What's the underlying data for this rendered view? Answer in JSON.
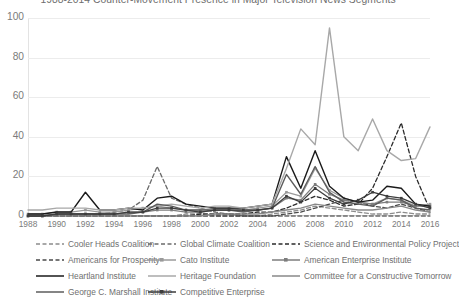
{
  "chart_data": {
    "type": "line",
    "title": "1988-2014 Counter-Movement Presence in Major Television News Segments",
    "xlabel": "",
    "ylabel": "",
    "ylim": [
      0,
      100
    ],
    "yticks": [
      0,
      20,
      40,
      60,
      80,
      100
    ],
    "xlim": [
      1988,
      2016
    ],
    "xticks": [
      1988,
      1990,
      1992,
      1994,
      1996,
      1998,
      2000,
      2002,
      2004,
      2006,
      2008,
      2010,
      2012,
      2014,
      2016
    ],
    "grid": true,
    "legend_position": "bottom",
    "x": [
      1988,
      1989,
      1990,
      1991,
      1992,
      1993,
      1994,
      1995,
      1996,
      1997,
      1998,
      1999,
      2000,
      2001,
      2002,
      2003,
      2004,
      2005,
      2006,
      2007,
      2008,
      2009,
      2010,
      2011,
      2012,
      2013,
      2014,
      2015,
      2016
    ],
    "series": [
      {
        "name": "Cooler Heads Coalition",
        "style": "dashed",
        "color": "#8c8c8c",
        "values": [
          0,
          0,
          0,
          0,
          0,
          0,
          0,
          0,
          0,
          0,
          0,
          1,
          1,
          0,
          0,
          0,
          0,
          1,
          2,
          3,
          5,
          4,
          3,
          2,
          1,
          1,
          2,
          1,
          1
        ]
      },
      {
        "name": "Global Climate Coalition",
        "style": "dashed",
        "color": "#6b6b6b",
        "values": [
          0,
          0,
          0,
          0,
          0,
          1,
          2,
          3,
          8,
          25,
          9,
          6,
          4,
          2,
          1,
          0,
          0,
          0,
          0,
          0,
          0,
          0,
          0,
          0,
          0,
          0,
          0,
          0,
          0
        ]
      },
      {
        "name": "Science and Environmental Policy Project",
        "style": "dashed",
        "color": "#2b2b2b",
        "values": [
          0,
          0,
          0,
          0,
          0,
          0,
          0,
          0,
          0,
          0,
          0,
          0,
          1,
          1,
          1,
          1,
          2,
          2,
          4,
          7,
          10,
          8,
          5,
          6,
          14,
          30,
          47,
          20,
          3
        ]
      },
      {
        "name": "Americans for Prosperity",
        "style": "dashed",
        "color": "#4a4a4a",
        "values": [
          0,
          0,
          0,
          0,
          0,
          0,
          0,
          0,
          0,
          0,
          0,
          0,
          0,
          0,
          0,
          0,
          0,
          0,
          1,
          2,
          4,
          6,
          8,
          7,
          5,
          4,
          6,
          4,
          2
        ]
      },
      {
        "name": "Cato Institute",
        "style": "solid-marker",
        "color": "#9a9a9a",
        "values": [
          1,
          1,
          2,
          2,
          3,
          2,
          2,
          3,
          4,
          5,
          4,
          3,
          3,
          4,
          4,
          3,
          4,
          5,
          12,
          10,
          24,
          13,
          9,
          7,
          6,
          9,
          8,
          5,
          6
        ]
      },
      {
        "name": "American Enterprise Institute",
        "style": "solid-marker",
        "color": "#7d7d7d",
        "values": [
          0,
          0,
          1,
          1,
          1,
          1,
          1,
          2,
          2,
          3,
          3,
          2,
          2,
          3,
          3,
          3,
          3,
          4,
          9,
          8,
          16,
          11,
          8,
          7,
          6,
          7,
          7,
          5,
          5
        ]
      },
      {
        "name": "Heartland Institute",
        "style": "solid",
        "color": "#1a1a1a",
        "values": [
          1,
          1,
          2,
          2,
          12,
          3,
          3,
          4,
          3,
          9,
          10,
          6,
          5,
          4,
          4,
          4,
          5,
          6,
          30,
          14,
          33,
          15,
          9,
          7,
          8,
          15,
          14,
          6,
          5
        ]
      },
      {
        "name": "Heritage Foundation",
        "style": "solid",
        "color": "#a8a8a8",
        "values": [
          3,
          3,
          4,
          4,
          4,
          3,
          3,
          4,
          4,
          5,
          6,
          5,
          4,
          5,
          5,
          4,
          5,
          6,
          24,
          44,
          36,
          95,
          40,
          33,
          49,
          33,
          28,
          29,
          45
        ]
      },
      {
        "name": "Committee for a Constructive Tomorrow",
        "style": "solid",
        "color": "#888888",
        "values": [
          0,
          0,
          0,
          0,
          0,
          0,
          0,
          0,
          0,
          0,
          0,
          0,
          0,
          1,
          1,
          1,
          1,
          2,
          3,
          4,
          6,
          5,
          4,
          3,
          3,
          4,
          5,
          3,
          2
        ]
      },
      {
        "name": "George C. Marshall Institute",
        "style": "solid",
        "color": "#5c5c5c",
        "values": [
          0,
          0,
          1,
          1,
          1,
          1,
          1,
          1,
          2,
          6,
          5,
          3,
          3,
          3,
          3,
          2,
          3,
          4,
          21,
          11,
          25,
          12,
          7,
          6,
          5,
          9,
          8,
          4,
          3
        ]
      },
      {
        "name": "Competitive Enterprise",
        "style": "solid-marker",
        "color": "#3d3d3d",
        "values": [
          0,
          0,
          1,
          1,
          1,
          1,
          1,
          2,
          2,
          4,
          4,
          3,
          2,
          3,
          3,
          3,
          3,
          4,
          10,
          7,
          14,
          9,
          6,
          8,
          12,
          10,
          9,
          6,
          4
        ]
      }
    ]
  },
  "axis": {
    "y_labels": [
      "100",
      "80",
      "60",
      "40",
      "20",
      "0"
    ],
    "x_labels": [
      "1988",
      "1990",
      "1992",
      "1994",
      "1996",
      "1998",
      "2000",
      "2002",
      "2004",
      "2006",
      "2008",
      "2010",
      "2012",
      "2014",
      "2016"
    ]
  },
  "legend": {
    "rows": [
      [
        {
          "label": "Cooler Heads Coalition",
          "style": "dashed",
          "color": "#8c8c8c"
        },
        {
          "label": "Global Climate Coalition",
          "style": "dashed",
          "color": "#6b6b6b"
        },
        {
          "label": "Science and Environmental Policy Project",
          "style": "dashed",
          "color": "#2b2b2b"
        }
      ],
      [
        {
          "label": "Americans for Prosperity",
          "style": "dashed",
          "color": "#4a4a4a"
        },
        {
          "label": "Cato Institute",
          "style": "solid-marker",
          "color": "#9a9a9a"
        },
        {
          "label": "American Enterprise Institute",
          "style": "solid-marker",
          "color": "#7d7d7d"
        }
      ],
      [
        {
          "label": "Heartland Institute",
          "style": "solid",
          "color": "#1a1a1a"
        },
        {
          "label": "Heritage Foundation",
          "style": "solid",
          "color": "#a8a8a8"
        },
        {
          "label": "Committee for a Constructive Tomorrow",
          "style": "solid",
          "color": "#888888"
        }
      ],
      [
        {
          "label": "George C. Marshall Institute",
          "style": "solid",
          "color": "#5c5c5c"
        },
        {
          "label": "Competitive Enterprise",
          "style": "solid-marker",
          "color": "#3d3d3d"
        }
      ]
    ]
  }
}
